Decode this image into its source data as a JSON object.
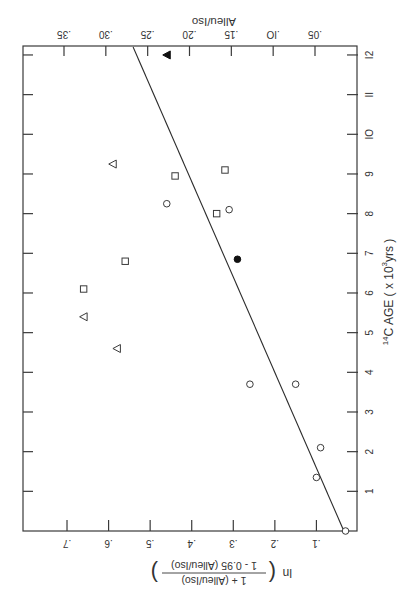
{
  "chart_data": {
    "type": "scatter",
    "orientation_note": "figure printed rotated 90 degrees counter-clockwise",
    "title": "",
    "xlabel": "14C AGE ( x 10^3 yrs )",
    "xlabel_parts": {
      "sup_pre": "14",
      "main": "C  AGE ( x 10",
      "sup": "3",
      "post": "yrs )"
    },
    "ylabel": "ln ( (1 + (Alleu/Iso)) / (1 - 0.95 (Alleu/Iso)) )",
    "ylabel_parts": {
      "ln": "ln",
      "numerator": "1 + (Alleu/Iso)",
      "denominator": "1 - 0.95 (Alleu/Iso)"
    },
    "y2label": "Alleu/Iso",
    "xlim": [
      0,
      12.2
    ],
    "ylim": [
      0,
      0.8
    ],
    "x_ticks": [
      1,
      2,
      3,
      4,
      5,
      6,
      7,
      8,
      9,
      10,
      11,
      12
    ],
    "x_tick_labels": [
      "1",
      "2",
      "3",
      "4",
      "5",
      "6",
      "7",
      "8",
      "9",
      "IO",
      "II",
      "I2"
    ],
    "y_ticks": [
      0.1,
      0.2,
      0.3,
      0.4,
      0.5,
      0.6,
      0.7
    ],
    "y_tick_labels": [
      ".1",
      ".2",
      ".3",
      ".4",
      ".5",
      ".6",
      ".7"
    ],
    "y2_ticks": [
      0.05,
      0.1,
      0.15,
      0.2,
      0.25,
      0.3,
      0.35
    ],
    "y2_tick_labels": [
      ".05",
      ".IO",
      ".15",
      ".20",
      ".25",
      ".30",
      ".35"
    ],
    "grid": false,
    "series": [
      {
        "name": "open circles",
        "marker": "circle",
        "filled": false,
        "points": [
          [
            0,
            0.03
          ],
          [
            1.35,
            0.1
          ],
          [
            2.1,
            0.09
          ],
          [
            3.7,
            0.15
          ],
          [
            3.7,
            0.26
          ],
          [
            8.1,
            0.31
          ],
          [
            8.25,
            0.46
          ]
        ]
      },
      {
        "name": "filled circle",
        "marker": "circle",
        "filled": true,
        "points": [
          [
            6.85,
            0.29
          ]
        ]
      },
      {
        "name": "open squares",
        "marker": "square",
        "filled": false,
        "points": [
          [
            6.1,
            0.66
          ],
          [
            6.8,
            0.56
          ],
          [
            8.0,
            0.34
          ],
          [
            8.95,
            0.44
          ],
          [
            9.1,
            0.32
          ]
        ]
      },
      {
        "name": "open triangles",
        "marker": "triangle",
        "filled": false,
        "points": [
          [
            4.6,
            0.58
          ],
          [
            5.4,
            0.66
          ],
          [
            9.25,
            0.59
          ]
        ]
      },
      {
        "name": "filled triangle",
        "marker": "triangle",
        "filled": true,
        "points": [
          [
            12.0,
            0.46
          ]
        ]
      }
    ],
    "fit_line": {
      "x": [
        0,
        12.2
      ],
      "y": [
        0.034,
        0.541
      ]
    }
  }
}
